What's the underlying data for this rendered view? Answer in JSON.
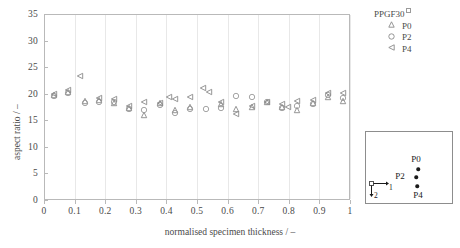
{
  "chart_data": {
    "type": "scatter",
    "title": "",
    "xlabel": "normalised specimen thickness / –",
    "ylabel": "aspect ratio / –",
    "xlim": [
      0,
      1
    ],
    "ylim": [
      0,
      35
    ],
    "xticks": [
      "0",
      "0.1",
      "0.2",
      "0.3",
      "0.4",
      "0.5",
      "0.6",
      "0.7",
      "0.8",
      "0.9",
      "1"
    ],
    "xtick_values": [
      0,
      0.1,
      0.2,
      0.3,
      0.4,
      0.5,
      0.6,
      0.7,
      0.8,
      0.9,
      1
    ],
    "yticks": [
      "0",
      "5",
      "10",
      "15",
      "20",
      "25",
      "30",
      "35"
    ],
    "ytick_values": [
      0,
      5,
      10,
      15,
      20,
      25,
      30,
      35
    ],
    "grid": "vertical",
    "legend_position": "top-right",
    "legend_title": "PPGF30",
    "series": [
      {
        "name": "P0",
        "marker": "triangle-up",
        "color": "#8a8a8a",
        "points": [
          {
            "x": 0.03,
            "y": 19.9
          },
          {
            "x": 0.075,
            "y": 20.5
          },
          {
            "x": 0.13,
            "y": 18.9
          },
          {
            "x": 0.175,
            "y": 19.0
          },
          {
            "x": 0.225,
            "y": 18.4
          },
          {
            "x": 0.275,
            "y": 17.5
          },
          {
            "x": 0.325,
            "y": 16.1
          },
          {
            "x": 0.375,
            "y": 18.4
          },
          {
            "x": 0.425,
            "y": 17.2
          },
          {
            "x": 0.475,
            "y": 17.6
          },
          {
            "x": 0.575,
            "y": 18.2
          },
          {
            "x": 0.625,
            "y": 17.3
          },
          {
            "x": 0.675,
            "y": 17.6
          },
          {
            "x": 0.725,
            "y": 18.6
          },
          {
            "x": 0.775,
            "y": 17.6
          },
          {
            "x": 0.825,
            "y": 17.2
          },
          {
            "x": 0.875,
            "y": 18.5
          },
          {
            "x": 0.925,
            "y": 19.6
          },
          {
            "x": 0.975,
            "y": 18.8
          }
        ]
      },
      {
        "name": "P2",
        "marker": "circle",
        "color": "#9a9a9a",
        "points": [
          {
            "x": 0.03,
            "y": 19.8
          },
          {
            "x": 0.075,
            "y": 20.4
          },
          {
            "x": 0.13,
            "y": 18.5
          },
          {
            "x": 0.175,
            "y": 18.7
          },
          {
            "x": 0.225,
            "y": 18.6
          },
          {
            "x": 0.275,
            "y": 17.3
          },
          {
            "x": 0.325,
            "y": 17.2
          },
          {
            "x": 0.375,
            "y": 18.1
          },
          {
            "x": 0.425,
            "y": 16.5
          },
          {
            "x": 0.475,
            "y": 17.4
          },
          {
            "x": 0.525,
            "y": 17.4
          },
          {
            "x": 0.575,
            "y": 17.5
          },
          {
            "x": 0.625,
            "y": 19.7
          },
          {
            "x": 0.675,
            "y": 19.5
          },
          {
            "x": 0.725,
            "y": 18.6
          },
          {
            "x": 0.775,
            "y": 17.5
          },
          {
            "x": 0.825,
            "y": 17.9
          },
          {
            "x": 0.875,
            "y": 18.3
          },
          {
            "x": 0.925,
            "y": 19.9
          },
          {
            "x": 0.975,
            "y": 19.3
          }
        ]
      },
      {
        "name": "P4",
        "marker": "triangle-left",
        "color": "#8a8a8a",
        "points": [
          {
            "x": 0.03,
            "y": 20.1
          },
          {
            "x": 0.075,
            "y": 20.9
          },
          {
            "x": 0.115,
            "y": 23.6
          },
          {
            "x": 0.175,
            "y": 19.3
          },
          {
            "x": 0.225,
            "y": 19.2
          },
          {
            "x": 0.275,
            "y": 17.8
          },
          {
            "x": 0.325,
            "y": 18.6
          },
          {
            "x": 0.375,
            "y": 18.4
          },
          {
            "x": 0.405,
            "y": 19.6
          },
          {
            "x": 0.425,
            "y": 19.2
          },
          {
            "x": 0.475,
            "y": 19.5
          },
          {
            "x": 0.515,
            "y": 21.3
          },
          {
            "x": 0.535,
            "y": 20.6
          },
          {
            "x": 0.575,
            "y": 18.6
          },
          {
            "x": 0.625,
            "y": 16.3
          },
          {
            "x": 0.675,
            "y": 17.9
          },
          {
            "x": 0.725,
            "y": 18.7
          },
          {
            "x": 0.775,
            "y": 18.2
          },
          {
            "x": 0.795,
            "y": 17.7
          },
          {
            "x": 0.825,
            "y": 18.8
          },
          {
            "x": 0.875,
            "y": 19.0
          },
          {
            "x": 0.925,
            "y": 20.4
          },
          {
            "x": 0.975,
            "y": 20.3
          }
        ]
      }
    ]
  },
  "legend": {
    "title": "PPGF30",
    "title_superscript": "square-glyph",
    "entries": [
      {
        "label": "P0",
        "marker": "triangle-up"
      },
      {
        "label": "P2",
        "marker": "circle"
      },
      {
        "label": "P4",
        "marker": "triangle-left"
      }
    ]
  },
  "inset": {
    "labels": [
      {
        "text": "P0",
        "x": 50,
        "y": 27
      },
      {
        "text": "P2",
        "x": 34,
        "y": 44
      },
      {
        "text": "P4",
        "x": 52,
        "y": 63
      }
    ],
    "dots": [
      {
        "x": 52,
        "y": 37
      },
      {
        "x": 50,
        "y": 45
      },
      {
        "x": 51,
        "y": 54
      }
    ],
    "axis_indicator": {
      "label_horizontal": "1",
      "label_vertical": "2"
    }
  }
}
